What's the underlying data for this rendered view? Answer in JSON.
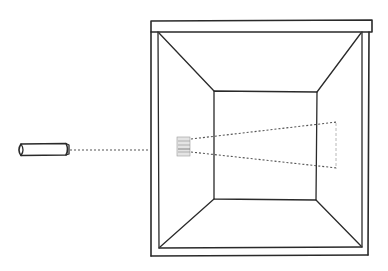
{
  "diagram": {
    "colors": {
      "ink": "#2a2a2a",
      "beam": "#555555",
      "faint": "#b8b8b8",
      "background": "#ffffff"
    },
    "flashlight": {
      "label": "flashlight",
      "x": 17,
      "y": 144,
      "width": 51,
      "height": 11
    },
    "box": {
      "label": "box",
      "outer": {
        "left": 151,
        "top": 21,
        "right": 369,
        "bottom": 255
      },
      "lid_bar": {
        "left": 151,
        "top": 21,
        "right": 372,
        "bottom": 32
      },
      "inner_frame": {
        "left": 158,
        "top": 32,
        "right": 362,
        "bottom": 247
      },
      "back_wall": {
        "left": 214,
        "top": 91,
        "right": 316,
        "bottom": 200
      }
    },
    "beam": {
      "label": "light beam",
      "incoming": {
        "x1": 68,
        "y1": 150,
        "x2": 151,
        "y2": 150
      },
      "source_patch": {
        "x": 177,
        "y": 136,
        "width": 14,
        "height": 20
      },
      "upper_ray": {
        "x1": 191,
        "y1": 139,
        "x2": 337,
        "y2": 122
      },
      "lower_ray": {
        "x1": 191,
        "y1": 152,
        "x2": 337,
        "y2": 168
      },
      "end_patch": {
        "x1": 336,
        "y1": 122,
        "x2": 336,
        "y2": 170
      }
    }
  }
}
